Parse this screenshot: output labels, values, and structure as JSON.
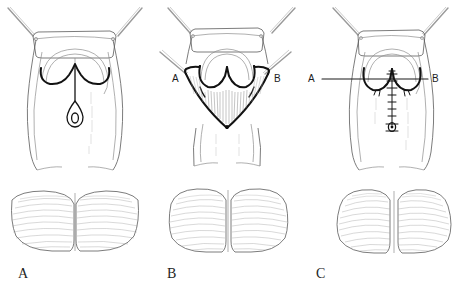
{
  "figure": {
    "background_color": "#ffffff",
    "ink_color": "#121212",
    "faint_ink_color": "#9a9a9a",
    "width": 457,
    "height": 287
  },
  "captions": [
    {
      "id": "caption-a",
      "label": "A",
      "x": 18,
      "y": 278
    },
    {
      "id": "caption-b",
      "label": "B",
      "x": 167,
      "y": 278
    },
    {
      "id": "caption-c",
      "label": "C",
      "x": 316,
      "y": 278
    }
  ],
  "panels": [
    {
      "id": "panel-a",
      "caption": "A",
      "top_view": {
        "name": "pre-operative-markings",
        "description": "Perineum held open by two retractors; heart-shaped dark incision outline with midline vertical line ending in a teardrop-shaped sinus opening.",
        "annotations": []
      },
      "bottom_view": {
        "name": "gluteal-view-a",
        "description": "Posterior gluteal view, cleft visible, broad flat buttocks with fine horizontal hatching."
      }
    },
    {
      "id": "panel-b",
      "caption": "B",
      "top_view": {
        "name": "flap-elevation",
        "description": "V-shaped bilateral flap elevated and reflected; raw dissected bed shown with dense vertical hatching; apex marked with a dot.",
        "annotations": [
          {
            "id": "flap-point-a",
            "label": "A",
            "x": 178,
            "y": 79,
            "side": "left"
          },
          {
            "id": "flap-point-b",
            "label": "B",
            "x": 272,
            "y": 79,
            "side": "right"
          }
        ]
      },
      "bottom_view": {
        "name": "gluteal-view-b",
        "description": "Posterior gluteal view after flap elevation, slightly narrowed cleft, rounded buttock contours."
      }
    },
    {
      "id": "panel-c",
      "caption": "C",
      "top_view": {
        "name": "closure-and-suture-line",
        "description": "Flaps advanced and closed; horizontal reference line A to B drawn across the repair; vertical midline suture line with transverse suture ticks terminating at the sinus.",
        "annotations": [
          {
            "id": "line-point-a",
            "label": "A",
            "x": 312,
            "y": 79,
            "side": "left"
          },
          {
            "id": "line-point-b",
            "label": "B",
            "x": 437,
            "y": 79,
            "side": "right"
          }
        ]
      },
      "bottom_view": {
        "name": "gluteal-view-c",
        "description": "Posterior gluteal view after closure; fuller, more rounded buttocks with flattened cleft."
      }
    }
  ],
  "legend": {
    "solid_bold_line": "incision / flap margin",
    "hatched_area": "raw dissected surface",
    "tick_marks": "suture line",
    "thin_grey_lines": "retractors and skin contour"
  }
}
